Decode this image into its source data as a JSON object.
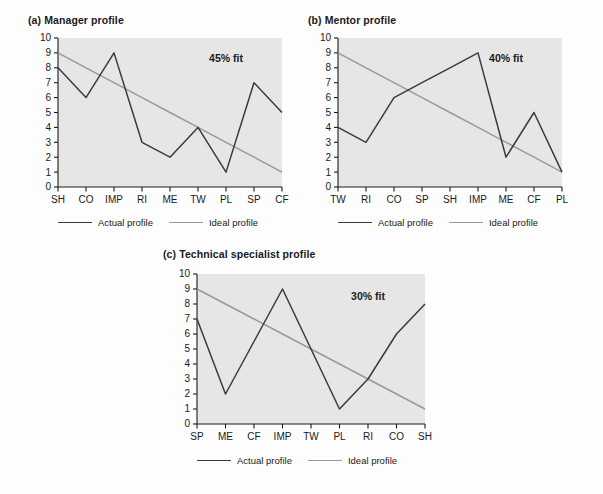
{
  "figure": {
    "background": "#fdfdfd",
    "plot_background": "#e6e6e6",
    "actual_color": "#3a3a42",
    "ideal_color": "#9a9a9a",
    "axis_color": "#1a1a1a"
  },
  "legend": {
    "actual_label": "Actual profile",
    "ideal_label": "Ideal profile"
  },
  "chart_data": [
    {
      "type": "line",
      "panel": "a",
      "title": "(a) Manager profile",
      "annotation": "45% fit",
      "categories": [
        "SH",
        "CO",
        "IMP",
        "RI",
        "ME",
        "TW",
        "PL",
        "SP",
        "CF"
      ],
      "series": [
        {
          "name": "Actual profile",
          "values": [
            8,
            6,
            9,
            3,
            2,
            4,
            1,
            7,
            5
          ]
        },
        {
          "name": "Ideal profile",
          "values": [
            9,
            8,
            7,
            6,
            5,
            4,
            3,
            2,
            1
          ]
        }
      ],
      "xlabel": "",
      "ylabel": "",
      "ylim": [
        0,
        10
      ],
      "yticks": [
        0,
        1,
        2,
        3,
        4,
        5,
        6,
        7,
        8,
        9,
        10
      ],
      "grid": false,
      "legend_position": "bottom"
    },
    {
      "type": "line",
      "panel": "b",
      "title": "(b) Mentor profile",
      "annotation": "40% fit",
      "categories": [
        "TW",
        "RI",
        "CO",
        "SP",
        "SH",
        "IMP",
        "ME",
        "CF",
        "PL"
      ],
      "series": [
        {
          "name": "Actual profile",
          "values": [
            4,
            3,
            6,
            7,
            8,
            9,
            2,
            5,
            1
          ]
        },
        {
          "name": "Ideal profile",
          "values": [
            9,
            8,
            7,
            6,
            5,
            4,
            3,
            2,
            1
          ]
        }
      ],
      "xlabel": "",
      "ylabel": "",
      "ylim": [
        0,
        10
      ],
      "yticks": [
        0,
        1,
        2,
        3,
        4,
        5,
        6,
        7,
        8,
        9,
        10
      ],
      "grid": false,
      "legend_position": "bottom"
    },
    {
      "type": "line",
      "panel": "c",
      "title": "(c) Technical specialist profile",
      "annotation": "30% fit",
      "categories": [
        "SP",
        "ME",
        "CF",
        "IMP",
        "TW",
        "PL",
        "RI",
        "CO",
        "SH"
      ],
      "series": [
        {
          "name": "Actual profile",
          "values": [
            7,
            2,
            5.5,
            9,
            5,
            1,
            3,
            6,
            8
          ]
        },
        {
          "name": "Ideal profile",
          "values": [
            9,
            8,
            7,
            6,
            5,
            4,
            3,
            2,
            1
          ]
        }
      ],
      "xlabel": "",
      "ylabel": "",
      "ylim": [
        0,
        10
      ],
      "yticks": [
        0,
        1,
        2,
        3,
        4,
        5,
        6,
        7,
        8,
        9,
        10
      ],
      "grid": false,
      "legend_position": "bottom"
    }
  ]
}
